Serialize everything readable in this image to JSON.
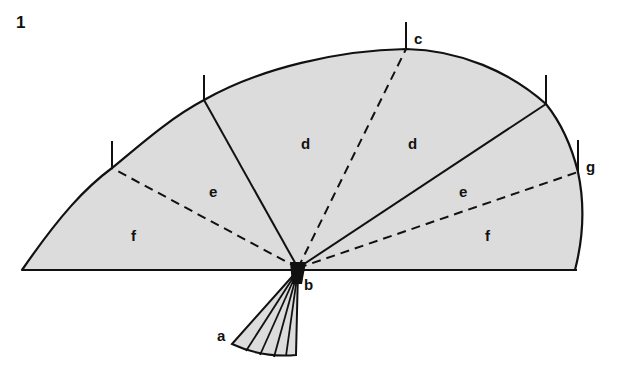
{
  "figure": {
    "number": "1",
    "colors": {
      "fill": "#dcdcdc",
      "stroke": "#111111",
      "background": "#ffffff"
    },
    "labels": {
      "a": "a",
      "b": "b",
      "c": "c",
      "g": "g",
      "d_left": "d",
      "d_right": "d",
      "e_left": "e",
      "e_right": "e",
      "f_left": "f",
      "f_right": "f"
    }
  }
}
